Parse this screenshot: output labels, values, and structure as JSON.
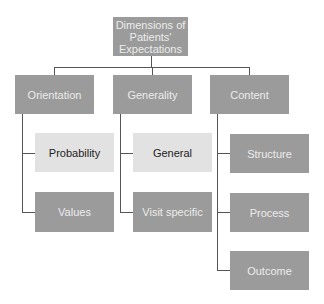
{
  "diagram": {
    "root": {
      "label": "Dimensions of Patients' Expectations",
      "lines": [
        "Dimensions of",
        "Patients'",
        "Expectations"
      ]
    },
    "columns": [
      {
        "label": "Orientation",
        "children": [
          {
            "label": "Probability",
            "style": "light"
          },
          {
            "label": "Values",
            "style": "dark"
          }
        ]
      },
      {
        "label": "Generality",
        "children": [
          {
            "label": "General",
            "style": "light"
          },
          {
            "label": "Visit specific",
            "style": "dark"
          }
        ]
      },
      {
        "label": "Content",
        "children": [
          {
            "label": "Structure",
            "style": "dark"
          },
          {
            "label": "Process",
            "style": "dark"
          },
          {
            "label": "Outcome",
            "style": "dark"
          }
        ]
      }
    ]
  },
  "colors": {
    "dark_box": "#9b9b9b",
    "light_box": "#e2e2e2",
    "connector": "#555555"
  }
}
